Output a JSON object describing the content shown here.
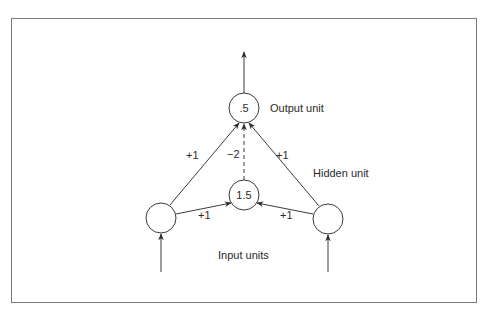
{
  "diagram": {
    "type": "neural-network",
    "nodes": {
      "output": {
        "value": ".5",
        "label": "Output unit"
      },
      "hidden": {
        "value": "1.5",
        "label": "Hidden unit"
      },
      "input_left": {
        "value": ""
      },
      "input_right": {
        "value": ""
      },
      "input_label": "Input units"
    },
    "weights": {
      "left_to_output": "+1",
      "right_to_output": "+1",
      "hidden_to_output": "−2",
      "left_to_hidden": "+1",
      "right_to_hidden": "+1"
    }
  }
}
